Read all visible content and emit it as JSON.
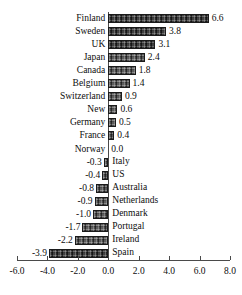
{
  "chart_data": {
    "type": "bar",
    "orientation": "horizontal",
    "title": "",
    "subtitle": "",
    "xlabel": "",
    "ylabel": "",
    "xlim": [
      -6.0,
      8.0
    ],
    "xticks": [
      "-6.0",
      "-4.0",
      "-2.0",
      "0.0",
      "2.0",
      "4.0",
      "6.0",
      "8.0"
    ],
    "xtick_values": [
      -6.0,
      -4.0,
      -2.0,
      0.0,
      2.0,
      4.0,
      6.0,
      8.0
    ],
    "grid": false,
    "legend": "none",
    "zero_line": true,
    "categories": [
      "Finland",
      "Sweden",
      "UK",
      "Japan",
      "Canada",
      "Belgium",
      "Switzerland",
      "New",
      "Germany",
      "France",
      "Norway",
      "Italy",
      "US",
      "Australia",
      "Netherlands",
      "Denmark",
      "Portugal",
      "Ireland",
      "Spain"
    ],
    "values": [
      6.6,
      3.8,
      3.1,
      2.4,
      1.8,
      1.4,
      0.9,
      0.6,
      0.5,
      0.4,
      0.0,
      -0.3,
      -0.4,
      -0.8,
      -0.9,
      -1.0,
      -1.7,
      -2.2,
      -3.9
    ],
    "data_labels": [
      "6.6",
      "3.8",
      "3.1",
      "2.4",
      "1.8",
      "1.4",
      "0.9",
      "0.6",
      "0.5",
      "0.4",
      "0.0",
      "-0.3",
      "-0.4",
      "-0.8",
      "-0.9",
      "-1.0",
      "-1.7",
      "-2.2",
      "-3.9"
    ],
    "bar_color": "#4a4a4a",
    "bar_edge_color": "#1b1b1b",
    "background_color": "#ffffff",
    "text_color": "#0d0d0d",
    "axis_color": "#4a4a4a"
  }
}
